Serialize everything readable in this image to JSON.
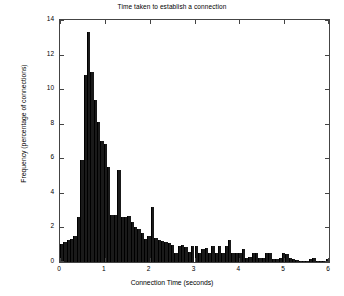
{
  "chart_data": {
    "type": "bar",
    "title": "Time taken to establish a connection",
    "xlabel": "Connection Time (seconds)",
    "ylabel": "Frequency (percentage of connections)",
    "xlim": [
      0,
      6
    ],
    "ylim": [
      0,
      14
    ],
    "xticks": [
      0,
      1,
      2,
      3,
      4,
      5,
      6
    ],
    "xtick_labels": [
      "0",
      "1",
      "2",
      "3",
      "4",
      "5",
      "6"
    ],
    "yticks": [
      0,
      2,
      4,
      6,
      8,
      10,
      12,
      14
    ],
    "ytick_labels": [
      "0",
      "2",
      "4",
      "6",
      "8",
      "10",
      "12",
      "14"
    ],
    "grid": false,
    "legend": null,
    "bin_width": 0.075,
    "bar_color": "#1a1a1a",
    "x": [
      0.0375,
      0.1125,
      0.1875,
      0.2625,
      0.3375,
      0.4125,
      0.4875,
      0.5625,
      0.6375,
      0.7125,
      0.7875,
      0.8625,
      0.9375,
      1.0125,
      1.0875,
      1.1625,
      1.2375,
      1.3125,
      1.3875,
      1.4625,
      1.5375,
      1.6125,
      1.6875,
      1.7625,
      1.8375,
      1.9125,
      1.9875,
      2.0625,
      2.1375,
      2.2125,
      2.2875,
      2.3625,
      2.4375,
      2.5125,
      2.5875,
      2.6625,
      2.7375,
      2.8125,
      2.8875,
      2.9625,
      3.0375,
      3.1125,
      3.1875,
      3.2625,
      3.3375,
      3.4125,
      3.4875,
      3.5625,
      3.6375,
      3.7125,
      3.7875,
      3.8625,
      3.9375,
      4.0125,
      4.0875,
      4.1625,
      4.2375,
      4.3125,
      4.3875,
      4.4625,
      4.5375,
      4.6125,
      4.6875,
      4.7625,
      4.8375,
      4.9125,
      4.9875,
      5.0625,
      5.1375,
      5.2125,
      5.2875,
      5.3625,
      5.4375,
      5.5125,
      5.5875,
      5.6625,
      5.7375,
      5.8125,
      5.8875,
      5.9625
    ],
    "values": [
      1.05,
      1.15,
      1.25,
      1.35,
      1.5,
      2.6,
      5.9,
      10.8,
      13.3,
      11.0,
      9.4,
      8.1,
      7.0,
      6.8,
      5.5,
      2.7,
      2.7,
      5.3,
      2.6,
      2.6,
      2.65,
      2.3,
      2.0,
      1.9,
      1.65,
      1.35,
      1.5,
      3.2,
      1.4,
      1.25,
      1.2,
      1.15,
      1.1,
      1.0,
      0.55,
      0.9,
      1.0,
      0.85,
      0.6,
      0.95,
      0.95,
      0.5,
      0.75,
      0.8,
      0.55,
      0.95,
      0.5,
      0.95,
      0.55,
      0.95,
      1.3,
      0.5,
      0.5,
      0.5,
      0.75,
      0.25,
      0.3,
      0.5,
      0.5,
      0.25,
      0.25,
      0.5,
      0.55,
      0.2,
      0.2,
      0.25,
      0.5,
      0.45,
      0.25,
      0.15,
      0.1,
      0.05,
      0.05,
      0.05,
      0.2,
      0.25,
      0.05,
      0.05,
      0.05,
      0.2
    ]
  }
}
